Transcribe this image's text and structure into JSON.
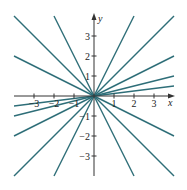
{
  "diagram": {
    "type": "line-family",
    "axes": {
      "x_label": "x",
      "y_label": "y",
      "xlim": [
        -4,
        4
      ],
      "ylim": [
        -4,
        4
      ],
      "x_ticks": [
        {
          "value": -3,
          "label": "−3"
        },
        {
          "value": -2,
          "label": "−2"
        },
        {
          "value": -1,
          "label": "−1"
        },
        {
          "value": 1,
          "label": "1"
        },
        {
          "value": 2,
          "label": "2"
        },
        {
          "value": 3,
          "label": "3"
        }
      ],
      "y_ticks": [
        {
          "value": 3,
          "label": "3"
        },
        {
          "value": 2,
          "label": "2"
        },
        {
          "value": 1,
          "label": "1"
        },
        {
          "value": -1,
          "label": "−1"
        },
        {
          "value": -2,
          "label": "−2"
        },
        {
          "value": -3,
          "label": "−3"
        }
      ]
    },
    "line_color": "#2e6e78",
    "axis_color": "#333333",
    "lines": [
      {
        "slope": 2
      },
      {
        "slope": 1
      },
      {
        "slope": 0.5
      },
      {
        "slope": 0.25
      },
      {
        "slope": 0.125
      },
      {
        "slope": -0.5
      },
      {
        "slope": -1
      },
      {
        "slope": -2
      }
    ]
  }
}
